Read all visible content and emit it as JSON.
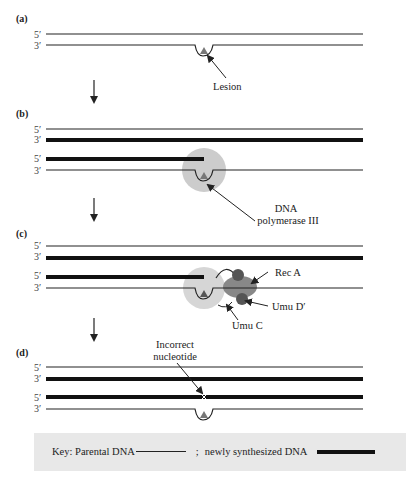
{
  "panels": [
    {
      "id": "a",
      "label": "(a)",
      "strand_labels": [
        "5′",
        "3′"
      ],
      "annotation": "Lesion"
    },
    {
      "id": "b",
      "label": "(b)",
      "strand_labels": [
        "5′",
        "3′",
        "5′",
        "3′"
      ],
      "annotation": [
        "DNA",
        "polymerase III"
      ]
    },
    {
      "id": "c",
      "label": "(c)",
      "strand_labels": [
        "5′",
        "3′",
        "5′",
        "3′"
      ],
      "annotations": [
        "Rec A",
        "Umu D′",
        "Umu C"
      ]
    },
    {
      "id": "d",
      "label": "(d)",
      "strand_labels": [
        "5′",
        "3′",
        "5′",
        "3′"
      ],
      "annotation": [
        "Incorrect",
        "nucleotide"
      ]
    }
  ],
  "key": {
    "prefix": "Key:  Parental DNA",
    "separator": ";",
    "newly": "newly synthesized DNA"
  },
  "colors": {
    "strand": "#222222",
    "lesion": "#777777",
    "polymerase": "#cccccc",
    "reca": "#888888",
    "umud": "#555555",
    "key_bg": "#e8e8e8"
  }
}
